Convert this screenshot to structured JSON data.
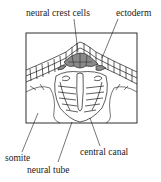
{
  "diagram": {
    "labels": {
      "neural_crest": "neural crest cells",
      "ectoderm": "ectoderm",
      "somite": "somite",
      "central_canal": "central canal",
      "neural_tube": "neural tube"
    },
    "colors": {
      "line": "#1a1a1a",
      "crest_fill": "#8a8a8a",
      "background": "#ffffff"
    }
  }
}
